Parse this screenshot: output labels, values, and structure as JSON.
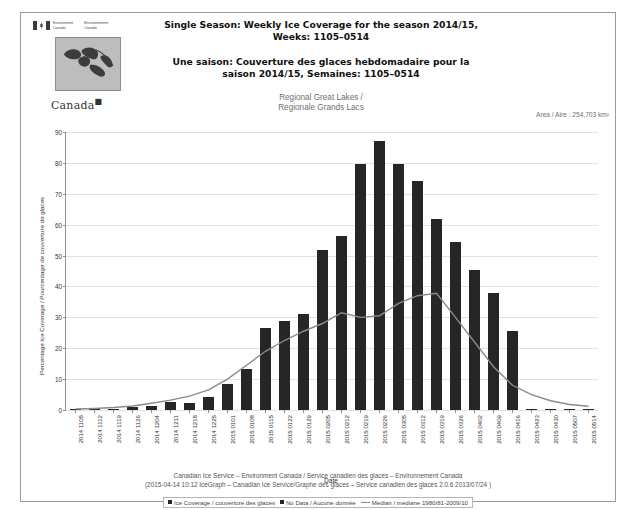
{
  "header": {
    "wordmark_line1_en": "Environment",
    "wordmark_line2_en": "Canada",
    "wordmark_line1_fr": "Environnement",
    "wordmark_line2_fr": "Canada",
    "canada_wordmark": "Canada",
    "title_en": "Single Season: Weekly Ice Coverage for the season 2014/15, Weeks: 1105–0514",
    "title_fr": "Une saison: Couverture des glaces hebdomadaire pour la saison 2014/15, Semaines: 1105–0514",
    "region_en": "Regional Great Lakes /",
    "region_fr": "Regionale Grands Lacs",
    "area_text": "Area / Aire : 254,703 km²"
  },
  "footer": {
    "line1": "Canadian Ice Service – Environment Canada / Service canadien des glaces – Environnement Canada",
    "line2": "(2015-04-14 10:12 IceGraph – Canadian Ice Service/Graphe des glaces – Service canadien des glaces 2.0.6 2013/07/24 )",
    "legend_coverage": "Ice Coverage / couverture des glaces",
    "legend_nodata": "No Data / Aucune donnée",
    "legend_median": "Median / médiane 1980/81-2009/10"
  },
  "colors": {
    "bar": "#262626",
    "median_line": "#8a8a8a",
    "grid": "#e2e2e2",
    "axis": "#8f8f8f"
  },
  "chart_data": {
    "type": "bar",
    "title": "Single Season: Weekly Ice Coverage for the season 2014/15, Weeks: 1105–0514",
    "xlabel": "Date",
    "ylabel": "Percentage Ice Coverage / Pourcentage de couverture de glaces",
    "ylim": [
      0,
      90
    ],
    "yticks": [
      0,
      10,
      20,
      30,
      40,
      50,
      60,
      70,
      80,
      90
    ],
    "grid": true,
    "legend_position": "bottom",
    "categories": [
      "2014 1105",
      "2014 1112",
      "2014 1119",
      "2014 1126",
      "2014 1204",
      "2014 1211",
      "2014 1218",
      "2014 1225",
      "2015 0101",
      "2015 0108",
      "2015 0115",
      "2015 0122",
      "2015 0129",
      "2015 0205",
      "2015 0212",
      "2015 0219",
      "2015 0226",
      "2015 0305",
      "2015 0312",
      "2015 0319",
      "2015 0326",
      "2015 0402",
      "2015 0409",
      "2015 0416",
      "2015 0423",
      "2015 0430",
      "2015 0507",
      "2015 0514"
    ],
    "series": [
      {
        "name": "Ice Coverage / couverture des glaces",
        "type": "bar",
        "values": [
          0.2,
          0.2,
          0.2,
          1.0,
          1.2,
          2.6,
          2.3,
          4.3,
          8.5,
          13.2,
          26.7,
          28.9,
          31.0,
          51.8,
          56.2,
          79.6,
          87.0,
          79.8,
          74.3,
          62.0,
          54.3,
          45.3,
          37.9,
          25.7,
          0.3,
          0.2,
          0.2,
          0.2
        ]
      },
      {
        "name": "Median / médiane 1980/81-2009/10",
        "type": "line",
        "values": [
          0.3,
          0.5,
          0.8,
          1.3,
          2.2,
          3.2,
          4.5,
          6.5,
          10.0,
          14.5,
          19.0,
          22.5,
          25.5,
          28.0,
          31.5,
          30.0,
          30.5,
          34.5,
          37.0,
          37.8,
          30.0,
          22.0,
          14.0,
          8.0,
          5.0,
          3.0,
          1.8,
          1.2
        ]
      }
    ],
    "no_data_categories": []
  }
}
